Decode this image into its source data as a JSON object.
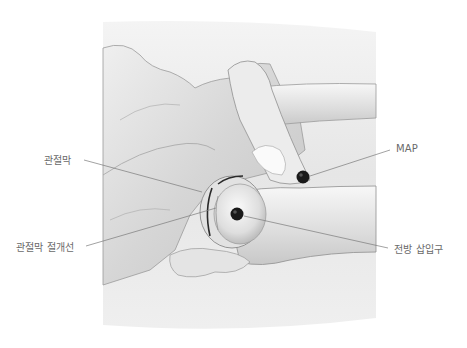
{
  "figure": {
    "labels": {
      "capsule": "관절막",
      "capsulotomy_line": "관절막 절개선",
      "map": "MAP",
      "anterior_portal": "전방 삽입구"
    },
    "colors": {
      "background": "#ffffff",
      "skin_panel": "#ececec",
      "bone_light": "#f2f2f2",
      "bone_shade": "#bdbdbd",
      "outline": "#8a8a8a",
      "portal_dot": "#1a1a1a",
      "leader_line": "#7a7a7a",
      "label_text": "#6a6a6a"
    }
  }
}
